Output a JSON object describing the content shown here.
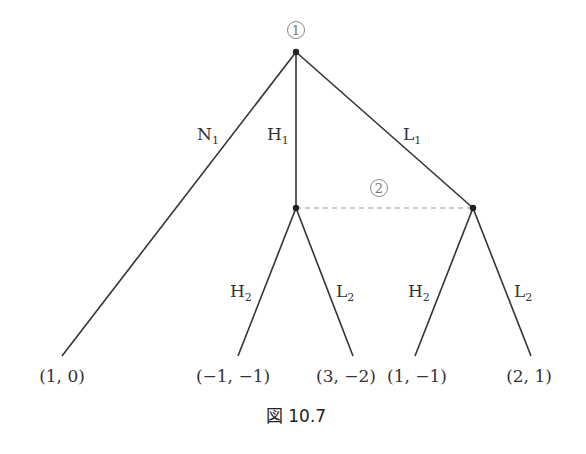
{
  "figure": {
    "caption": "図 10.7",
    "players": {
      "p1": "1",
      "p2": "2"
    },
    "edges": {
      "n1": {
        "base": "N",
        "sub": "1"
      },
      "h1": {
        "base": "H",
        "sub": "1"
      },
      "l1": {
        "base": "L",
        "sub": "1"
      },
      "h2a": {
        "base": "H",
        "sub": "2"
      },
      "l2a": {
        "base": "L",
        "sub": "2"
      },
      "h2b": {
        "base": "H",
        "sub": "2"
      },
      "l2b": {
        "base": "L",
        "sub": "2"
      }
    },
    "payoffs": {
      "n1": "(1, 0)",
      "h1h2": "(−1, −1)",
      "h1l2": "(3, −2)",
      "l1h2": "(1, −1)",
      "l1l2": "(2, 1)"
    },
    "colors": {
      "edge": "#333333",
      "info_set": "#999999",
      "player_label": "#777777"
    }
  }
}
